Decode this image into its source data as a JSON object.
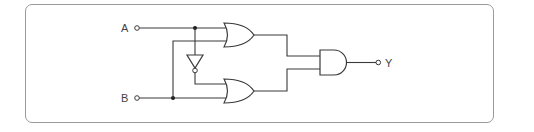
{
  "diagram": {
    "type": "logic-circuit",
    "inputs": [
      {
        "id": "A",
        "label": "A"
      },
      {
        "id": "B",
        "label": "B"
      }
    ],
    "outputs": [
      {
        "id": "Y",
        "label": "Y"
      }
    ],
    "gates": [
      {
        "id": "not1",
        "type": "NOT",
        "inputs": [
          "A"
        ]
      },
      {
        "id": "or1",
        "type": "OR",
        "inputs": [
          "A",
          "B"
        ]
      },
      {
        "id": "or2",
        "type": "OR",
        "inputs": [
          "not1",
          "B"
        ]
      },
      {
        "id": "and1",
        "type": "AND",
        "inputs": [
          "or1",
          "or2"
        ],
        "output": "Y"
      }
    ],
    "colors": {
      "line": "#3a3a3a",
      "frame": "#9a9a9a",
      "background": "#ffffff"
    }
  }
}
